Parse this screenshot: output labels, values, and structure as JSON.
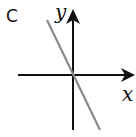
{
  "panel_label": "C",
  "axes": {
    "x_label": "x",
    "y_label": "y"
  },
  "colors": {
    "axis": "#111111",
    "line": "#8a8a8a",
    "background": "#ffffff"
  },
  "line": {
    "description": "straight line through origin with negative slope",
    "slope_sign": "negative",
    "passes_through_origin": true
  }
}
